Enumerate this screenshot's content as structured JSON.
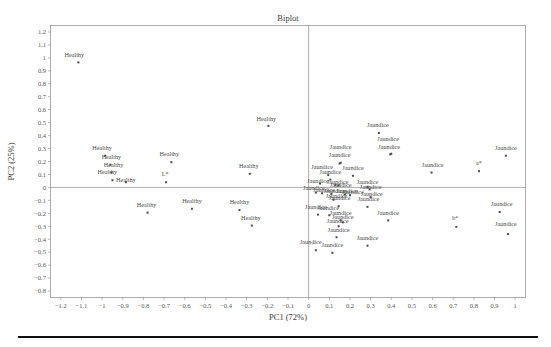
{
  "chart_data": {
    "type": "scatter",
    "title": "Biplot",
    "xlabel": "PC1 (72%)",
    "ylabel": "PC2 (25%)",
    "xlim": [
      -1.25,
      1.05
    ],
    "ylim": [
      -0.85,
      1.25
    ],
    "xticks": [
      -1.2,
      -1.1,
      -1,
      -0.9,
      -0.8,
      -0.7,
      -0.6,
      -0.5,
      -0.4,
      -0.3,
      -0.2,
      -0.1,
      0,
      0.1,
      0.2,
      0.3,
      0.4,
      0.5,
      0.6,
      0.7,
      0.8,
      0.9,
      1
    ],
    "xtick_labels": [
      "−1.2",
      "−1.1",
      "−1",
      "−0.9",
      "−0.8",
      "−0.7",
      "−0.6",
      "−0.5",
      "−0.4",
      "−0.3",
      "−0.2",
      "−0.1",
      "0",
      "0.1",
      "0.2",
      "0.3",
      "0.4",
      "0.5",
      "0.6",
      "0.7",
      "0.8",
      "0.9",
      "1"
    ],
    "yticks": [
      1.2,
      1.1,
      1,
      0.9,
      0.8,
      0.7,
      0.6,
      0.5,
      0.4,
      0.3,
      0.2,
      0.1,
      0,
      -0.1,
      -0.2,
      -0.3,
      -0.4,
      -0.5,
      -0.6,
      -0.7,
      -0.8
    ],
    "ytick_labels": [
      "1.2",
      "1.1",
      "1",
      "0.9",
      "0.8",
      "0.7",
      "0.6",
      "0.5",
      "0.4",
      "0.3",
      "0.2",
      "0.1",
      "0",
      "−0.1",
      "−0.2",
      "−0.3",
      "−0.4",
      "−0.5",
      "−0.6",
      "−0.7",
      "−0.8"
    ],
    "grid": false,
    "legend": "none",
    "zero_lines": true,
    "marker_color": "#4a4a4a",
    "frame_color": "#9a9a9a",
    "groups": [
      "Healthy",
      "Jaundice"
    ],
    "variable_labels": [
      "L*",
      "a*",
      "b*"
    ],
    "points": [
      {
        "label": "Healthy",
        "x": -1.115,
        "y": 0.965,
        "lx": -1.135,
        "ly": 1.005
      },
      {
        "label": "Healthy",
        "x": -0.195,
        "y": 0.475,
        "lx": -0.205,
        "ly": 0.515
      },
      {
        "label": "Healthy",
        "x": -0.985,
        "y": 0.245,
        "lx": -1.0,
        "ly": 0.29
      },
      {
        "label": "Healthy",
        "x": -0.96,
        "y": 0.175,
        "lx": -0.955,
        "ly": 0.22
      },
      {
        "label": "Healthy",
        "x": -0.955,
        "y": 0.115,
        "lx": -0.945,
        "ly": 0.155
      },
      {
        "label": "Healthy",
        "x": -0.95,
        "y": 0.055,
        "lx": -0.975,
        "ly": 0.1
      },
      {
        "label": "Healthy",
        "x": -0.885,
        "y": 0.04,
        "lx": -0.885,
        "ly": 0.045
      },
      {
        "label": "Healthy",
        "x": -0.665,
        "y": 0.195,
        "lx": -0.675,
        "ly": 0.24
      },
      {
        "label": "Healthy",
        "x": -0.285,
        "y": 0.105,
        "lx": -0.29,
        "ly": 0.15
      },
      {
        "label": "Healthy",
        "x": -0.78,
        "y": -0.195,
        "lx": -0.785,
        "ly": -0.15
      },
      {
        "label": "Healthy",
        "x": -0.565,
        "y": -0.165,
        "lx": -0.565,
        "ly": -0.12
      },
      {
        "label": "Healthy",
        "x": -0.335,
        "y": -0.175,
        "lx": -0.335,
        "ly": -0.125
      },
      {
        "label": "Healthy",
        "x": -0.275,
        "y": -0.295,
        "lx": -0.28,
        "ly": -0.25
      },
      {
        "label": "L*",
        "x": -0.69,
        "y": 0.04,
        "lx": -0.695,
        "ly": 0.085
      },
      {
        "label": "Jaundice",
        "x": 0.34,
        "y": 0.42,
        "lx": 0.335,
        "ly": 0.465
      },
      {
        "label": "Jaundice",
        "x": 0.4,
        "y": 0.26,
        "lx": 0.385,
        "ly": 0.355
      },
      {
        "label": "Jaundice",
        "x": 0.395,
        "y": 0.255,
        "lx": 0.39,
        "ly": 0.3
      },
      {
        "label": "Jaundice",
        "x": 0.155,
        "y": 0.19,
        "lx": 0.155,
        "ly": 0.3
      },
      {
        "label": "Jaundice",
        "x": 0.15,
        "y": 0.185,
        "lx": 0.15,
        "ly": 0.235
      },
      {
        "label": "Jaundice",
        "x": 0.955,
        "y": 0.245,
        "lx": 0.955,
        "ly": 0.29
      },
      {
        "label": "Jaundice",
        "x": 0.595,
        "y": 0.115,
        "lx": 0.6,
        "ly": 0.16
      },
      {
        "label": "Jaundice",
        "x": 0.095,
        "y": 0.095,
        "lx": 0.065,
        "ly": 0.145
      },
      {
        "label": "Jaundice",
        "x": 0.215,
        "y": 0.09,
        "lx": 0.215,
        "ly": 0.135
      },
      {
        "label": "Jaundice",
        "x": 0.105,
        "y": 0.06,
        "lx": 0.105,
        "ly": 0.105
      },
      {
        "label": "Jaundice",
        "x": 0.055,
        "y": 0.03,
        "lx": 0.045,
        "ly": 0.035
      },
      {
        "label": "Jaundice",
        "x": 0.13,
        "y": 0.02,
        "lx": 0.14,
        "ly": 0.03
      },
      {
        "label": "Jaundice",
        "x": 0.145,
        "y": 0.015,
        "lx": 0.155,
        "ly": 0.0
      },
      {
        "label": "Jaundice",
        "x": 0.285,
        "y": 0.005,
        "lx": 0.285,
        "ly": 0.025
      },
      {
        "label": "Jaundice",
        "x": 0.295,
        "y": -0.015,
        "lx": 0.3,
        "ly": -0.01
      },
      {
        "label": "Jaundice",
        "x": 0.035,
        "y": -0.04,
        "lx": 0.025,
        "ly": -0.02
      },
      {
        "label": "Jaundice",
        "x": 0.065,
        "y": -0.045,
        "lx": 0.075,
        "ly": -0.035
      },
      {
        "label": "Jaundice",
        "x": 0.11,
        "y": -0.05,
        "lx": 0.125,
        "ly": -0.04
      },
      {
        "label": "Jaundice",
        "x": 0.175,
        "y": -0.055,
        "lx": 0.185,
        "ly": -0.045
      },
      {
        "label": "Jaundice",
        "x": 0.2,
        "y": -0.06,
        "lx": 0.215,
        "ly": -0.05
      },
      {
        "label": "Jaundice",
        "x": 0.3,
        "y": -0.075,
        "lx": 0.305,
        "ly": -0.065
      },
      {
        "label": "Jaundice",
        "x": 0.12,
        "y": -0.095,
        "lx": 0.135,
        "ly": -0.08
      },
      {
        "label": "Jaundice",
        "x": 0.145,
        "y": -0.145,
        "lx": 0.15,
        "ly": -0.1
      },
      {
        "label": "Jaundice",
        "x": 0.285,
        "y": -0.15,
        "lx": 0.29,
        "ly": -0.105
      },
      {
        "label": "Jaundice",
        "x": 0.045,
        "y": -0.21,
        "lx": 0.035,
        "ly": -0.165
      },
      {
        "label": "Jaundice",
        "x": 0.1,
        "y": -0.215,
        "lx": 0.095,
        "ly": -0.175
      },
      {
        "label": "Jaundice",
        "x": 0.925,
        "y": -0.19,
        "lx": 0.935,
        "ly": -0.145
      },
      {
        "label": "Jaundice",
        "x": 0.385,
        "y": -0.255,
        "lx": 0.385,
        "ly": -0.21
      },
      {
        "label": "Jaundice",
        "x": 0.155,
        "y": -0.255,
        "lx": 0.155,
        "ly": -0.21
      },
      {
        "label": "Jaundice",
        "x": 0.165,
        "y": -0.27,
        "lx": 0.165,
        "ly": -0.245
      },
      {
        "label": "Jaundice",
        "x": 0.145,
        "y": -0.3,
        "lx": 0.14,
        "ly": -0.275
      },
      {
        "label": "Jaundice",
        "x": 0.965,
        "y": -0.36,
        "lx": 0.955,
        "ly": -0.295
      },
      {
        "label": "Jaundice",
        "x": 0.135,
        "y": -0.385,
        "lx": 0.145,
        "ly": -0.345
      },
      {
        "label": "Jaundice",
        "x": 0.285,
        "y": -0.45,
        "lx": 0.285,
        "ly": -0.405
      },
      {
        "label": "Jaundice",
        "x": 0.035,
        "y": -0.485,
        "lx": 0.01,
        "ly": -0.44
      },
      {
        "label": "Jaundice",
        "x": 0.115,
        "y": -0.505,
        "lx": 0.115,
        "ly": -0.46
      },
      {
        "label": "a*",
        "x": 0.825,
        "y": 0.125,
        "lx": 0.825,
        "ly": 0.175
      },
      {
        "label": "b*",
        "x": 0.715,
        "y": -0.305,
        "lx": 0.71,
        "ly": -0.255
      }
    ]
  }
}
